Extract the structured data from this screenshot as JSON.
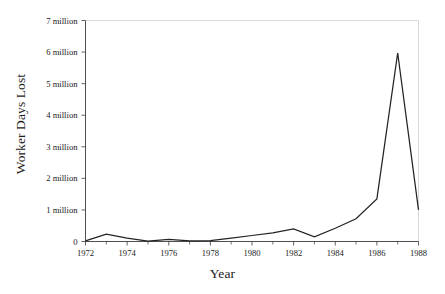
{
  "chart_data": {
    "type": "line",
    "title": "",
    "xlabel": "Year",
    "ylabel": "Worker Days Lost",
    "x": [
      1972,
      1973,
      1974,
      1975,
      1976,
      1977,
      1978,
      1979,
      1980,
      1981,
      1982,
      1983,
      1984,
      1985,
      1986,
      1987,
      1988
    ],
    "values": [
      20000,
      230000,
      110000,
      10000,
      70000,
      20000,
      30000,
      110000,
      190000,
      270000,
      400000,
      150000,
      420000,
      720000,
      1350000,
      5970000,
      1000000
    ],
    "series": [
      {
        "name": "Worker Days Lost",
        "values": [
          20000,
          230000,
          110000,
          10000,
          70000,
          20000,
          30000,
          110000,
          190000,
          270000,
          400000,
          150000,
          420000,
          720000,
          1350000,
          5970000,
          1000000
        ]
      }
    ],
    "xlim": [
      1972,
      1988
    ],
    "ylim": [
      0,
      7000000
    ],
    "grid": false,
    "legend": false,
    "legend_position": "none",
    "line_color": "#232323",
    "y_tick_values": [
      0,
      1000000,
      2000000,
      3000000,
      4000000,
      5000000,
      6000000,
      7000000
    ],
    "y_tick_labels": [
      "0",
      "1 million",
      "2 million",
      "3 million",
      "4 million",
      "5 million",
      "6 million",
      "7 million"
    ],
    "x_tick_values": [
      1972,
      1974,
      1976,
      1978,
      1980,
      1982,
      1984,
      1986,
      1988
    ],
    "x_tick_labels": [
      "1972",
      "1974",
      "1976",
      "1978",
      "1980",
      "1982",
      "1984",
      "1986",
      "1988"
    ],
    "x_minor_tick_values": [
      1973,
      1975,
      1977,
      1979,
      1981,
      1983,
      1985,
      1987
    ]
  },
  "axis_titles": {
    "y": "Worker Days Lost",
    "x": "Year"
  }
}
